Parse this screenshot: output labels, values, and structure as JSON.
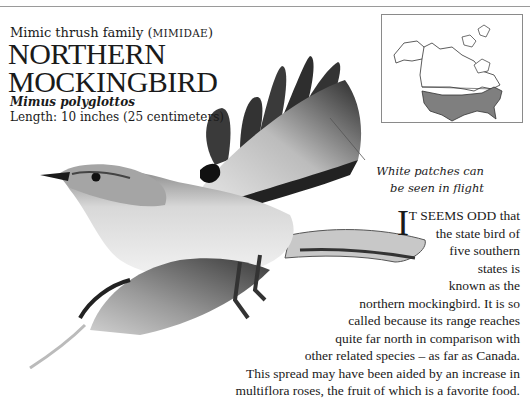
{
  "header": {
    "family_prefix": "Mimic thrush family (",
    "family_latin": "Mimidae",
    "family_suffix": ")",
    "title_line1": "NORTHERN",
    "title_line2": "MOCKINGBIRD",
    "scientific_name": "Mimus polyglottos",
    "length": "Length: 10 inches (25 centimeters)"
  },
  "map": {
    "label": "range-map-north-america",
    "range_color": "#7f7f7f"
  },
  "caption": {
    "line1": "White patches can",
    "line2": "be seen in flight"
  },
  "body": {
    "dropcap": "I",
    "lines": [
      "T SEEMS ODD that",
      "the state bird of",
      "five southern",
      "states is",
      "known as the",
      "northern mockingbird. It is so",
      "called because its range reaches",
      "quite far north in comparison with",
      "other related species – as far as Canada.",
      "This spread may have been aided by an increase in",
      "multiflora roses, the fruit of which is a favorite food."
    ]
  }
}
